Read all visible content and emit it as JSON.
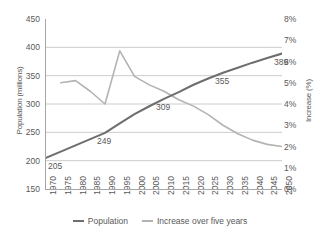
{
  "chart_data": {
    "type": "line",
    "title": "",
    "xlabel": "",
    "ylabel": "Population (millions)",
    "ylabel_right": "Increase (%)",
    "grid": true,
    "legend_position": "bottom",
    "categories": [
      "1970",
      "1975",
      "1980",
      "1985",
      "1990",
      "1995",
      "2000",
      "2005",
      "2010",
      "2015",
      "2020",
      "2025",
      "2030",
      "2035",
      "2040",
      "2045",
      "2050"
    ],
    "ylim": [
      150,
      450
    ],
    "yticks": [
      "150",
      "200",
      "250",
      "300",
      "350",
      "400",
      "450"
    ],
    "ylim_right": [
      0,
      8
    ],
    "yticks_right": [
      "0%",
      "1%",
      "2%",
      "3%",
      "4%",
      "5%",
      "6%",
      "7%",
      "8%"
    ],
    "series": [
      {
        "name": "Population",
        "axis": "left",
        "color": "#6e6e6e",
        "values": [
          205,
          216,
          227,
          238,
          249,
          266,
          282,
          296,
          309,
          321,
          334,
          345,
          355,
          364,
          373,
          381,
          389
        ],
        "point_labels": [
          {
            "category": "1970",
            "value": 205,
            "text": "205"
          },
          {
            "category": "1990",
            "value": 249,
            "text": "249"
          },
          {
            "category": "2010",
            "value": 309,
            "text": "309"
          },
          {
            "category": "2030",
            "value": 355,
            "text": "355"
          },
          {
            "category": "2050",
            "value": 389,
            "text": "389"
          }
        ]
      },
      {
        "name": "Increase over five years",
        "axis": "right",
        "color": "#b3b3b3",
        "values": [
          null,
          5.0,
          5.1,
          4.6,
          4.0,
          6.5,
          5.3,
          4.9,
          4.6,
          4.2,
          3.9,
          3.5,
          3.0,
          2.6,
          2.3,
          2.1,
          2.0
        ]
      }
    ]
  },
  "legend": {
    "items": [
      {
        "label": "Population",
        "color": "#6e6e6e"
      },
      {
        "label": "Increase over five years",
        "color": "#b3b3b3"
      }
    ]
  }
}
